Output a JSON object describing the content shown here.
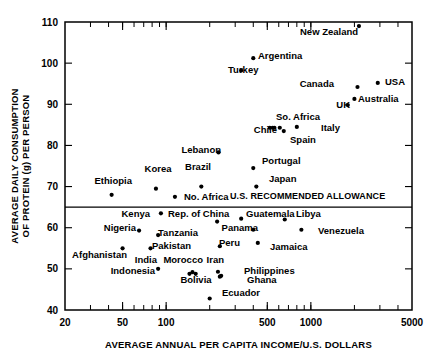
{
  "chart_data": {
    "type": "scatter",
    "title": "",
    "xlabel": "AVERAGE ANNUAL PER CAPITA INCOME/U.S. DOLLARS",
    "ylabel_line1": "AVERAGE DAILY CONSUMPTION",
    "ylabel_line2": "OF PROTEIN (g) PER PERSON",
    "xscale": "log",
    "yscale": "linear",
    "xlim": [
      20,
      5000
    ],
    "ylim": [
      40,
      110
    ],
    "grid": false,
    "legend": null,
    "xticks": [
      20,
      50,
      100,
      500,
      1000,
      5000
    ],
    "xtick_labels": [
      "20",
      "50",
      "100",
      "500",
      "1000",
      "5000"
    ],
    "yticks": [
      40,
      50,
      60,
      70,
      80,
      90,
      100,
      110
    ],
    "ytick_labels": [
      "40",
      "50",
      "60",
      "70",
      "80",
      "90",
      "100",
      "110"
    ],
    "annotations": [
      {
        "name": "us-recommended-allowance",
        "text": "U.S. RECOMMENDED ALLOWANCE",
        "type": "hline",
        "y": 65,
        "label_x": 230,
        "label_y": 199
      }
    ],
    "points": [
      {
        "label": "New Zealand",
        "x": 2150,
        "y": 109.0,
        "lx": 300,
        "ly": 35,
        "anchor": "start"
      },
      {
        "label": "Argentina",
        "x": 400,
        "y": 101.2,
        "lx": 258,
        "ly": 59,
        "anchor": "start"
      },
      {
        "label": "Turkey",
        "x": 330,
        "y": 98.2,
        "lx": 228,
        "ly": 73,
        "anchor": "start"
      },
      {
        "label": "USA",
        "x": 2900,
        "y": 95.2,
        "lx": 385,
        "ly": 85,
        "anchor": "start"
      },
      {
        "label": "Canada",
        "x": 2100,
        "y": 94.2,
        "lx": 334,
        "ly": 87,
        "anchor": "end"
      },
      {
        "label": "Australia",
        "x": 2000,
        "y": 91.3,
        "lx": 358,
        "ly": 102,
        "anchor": "start"
      },
      {
        "label": "UK",
        "x": 1800,
        "y": 89.8,
        "lx": 350,
        "ly": 108,
        "anchor": "end"
      },
      {
        "label": "So. Africa",
        "x": 610,
        "y": 84.3,
        "lx": 276,
        "ly": 120,
        "anchor": "start"
      },
      {
        "label": "Italy",
        "x": 800,
        "y": 84.5,
        "lx": 321,
        "ly": 131,
        "anchor": "start"
      },
      {
        "label": "Chile",
        "x": 560,
        "y": 84.3,
        "lx": 277,
        "ly": 133,
        "anchor": "end"
      },
      {
        "label": "Spain",
        "x": 650,
        "y": 83.5,
        "lx": 290,
        "ly": 143,
        "anchor": "start"
      },
      {
        "label": "Lebanon",
        "x": 230,
        "y": 78.3,
        "lx": 221,
        "ly": 153,
        "anchor": "end"
      },
      {
        "label": "Portugal",
        "x": 400,
        "y": 74.5,
        "lx": 262,
        "ly": 164,
        "anchor": "start"
      },
      {
        "label": "Brazil",
        "x": 175,
        "y": 70.0,
        "lx": 198,
        "ly": 170,
        "anchor": "middle"
      },
      {
        "label": "Japan",
        "x": 420,
        "y": 70.0,
        "lx": 269,
        "ly": 182,
        "anchor": "start"
      },
      {
        "label": "Korea",
        "x": 85,
        "y": 69.5,
        "lx": 158,
        "ly": 172,
        "anchor": "middle"
      },
      {
        "label": "Ethiopia",
        "x": 42,
        "y": 68.0,
        "lx": 132,
        "ly": 184,
        "anchor": "end"
      },
      {
        "label": "No. Africa",
        "x": 115,
        "y": 67.5,
        "lx": 184,
        "ly": 200,
        "anchor": "start"
      },
      {
        "label": "Kenya",
        "x": 92,
        "y": 63.5,
        "lx": 150,
        "ly": 217,
        "anchor": "end"
      },
      {
        "label": "Rep. of China",
        "x": 225,
        "y": 61.5,
        "lx": 168,
        "ly": 217,
        "anchor": "start"
      },
      {
        "label": "Guatemala",
        "x": 330,
        "y": 62.2,
        "lx": 246,
        "ly": 217,
        "anchor": "start"
      },
      {
        "label": "Libya",
        "x": 660,
        "y": 62.0,
        "lx": 296,
        "ly": 217,
        "anchor": "start"
      },
      {
        "label": "Nigeria",
        "x": 65,
        "y": 59.3,
        "lx": 136,
        "ly": 231,
        "anchor": "end"
      },
      {
        "label": "Tanzania",
        "x": 88,
        "y": 58.2,
        "lx": 158,
        "ly": 236,
        "anchor": "start"
      },
      {
        "label": "Panama",
        "x": 400,
        "y": 59.5,
        "lx": 258,
        "ly": 231,
        "anchor": "end"
      },
      {
        "label": "Venezuela",
        "x": 860,
        "y": 59.5,
        "lx": 318,
        "ly": 234,
        "anchor": "start"
      },
      {
        "label": "Pakistan",
        "x": 78,
        "y": 55.0,
        "lx": 152,
        "ly": 249,
        "anchor": "start"
      },
      {
        "label": "Peru",
        "x": 235,
        "y": 55.5,
        "lx": 219,
        "ly": 246,
        "anchor": "start"
      },
      {
        "label": "Jamaica",
        "x": 430,
        "y": 56.3,
        "lx": 270,
        "ly": 250,
        "anchor": "start"
      },
      {
        "label": "Afghanistan",
        "x": 50,
        "y": 55.0,
        "lx": 127,
        "ly": 258,
        "anchor": "end"
      },
      {
        "label": "India",
        "x": 88,
        "y": 50.0,
        "lx": 157,
        "ly": 263,
        "anchor": "end"
      },
      {
        "label": "Morocco",
        "x": 152,
        "y": 49.2,
        "lx": 203,
        "ly": 263,
        "anchor": "end"
      },
      {
        "label": "Iran",
        "x": 228,
        "y": 49.3,
        "lx": 224,
        "ly": 263,
        "anchor": "end"
      },
      {
        "label": "Indonesia",
        "x": 145,
        "y": 48.8,
        "lx": 155,
        "ly": 274,
        "anchor": "end"
      },
      {
        "label": "Philippines",
        "x": 240,
        "y": 48.3,
        "lx": 244,
        "ly": 274,
        "anchor": "start"
      },
      {
        "label": "Bolivia",
        "x": 160,
        "y": 48.8,
        "lx": 196,
        "ly": 283,
        "anchor": "middle"
      },
      {
        "label": "Ghana",
        "x": 235,
        "y": 48.1,
        "lx": 247,
        "ly": 283,
        "anchor": "start"
      },
      {
        "label": "Ecuador",
        "x": 200,
        "y": 42.8,
        "lx": 222,
        "ly": 296,
        "anchor": "start"
      }
    ],
    "extra_points": [
      {
        "name": "unlabeled-cluster-a",
        "x": 520,
        "y": 84.3
      },
      {
        "name": "unlabeled-cluster-b",
        "x": 545,
        "y": 84.3
      }
    ]
  }
}
